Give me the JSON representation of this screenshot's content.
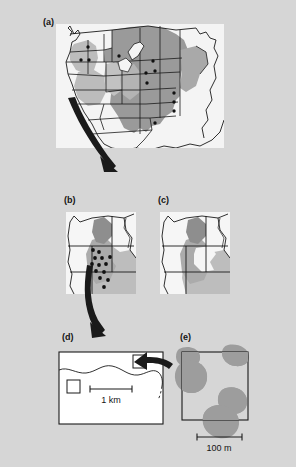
{
  "figure": {
    "type": "multi-panel-map-figure",
    "background_color": "#d6d6d6",
    "map_face_color": "#f2f2f2",
    "shade_dark": "#949494",
    "shade_mid": "#a8a8a8",
    "shade_light": "#bdbdbd",
    "outline_color": "#1a1a1a",
    "arrow_color": "#1a1a1a",
    "panels": [
      {
        "id": "a",
        "label": "(a)",
        "description": "Map of the western and central United States with state outlines; a broad block of north-central and central plains states is shaded gray, with smaller gray patches in the interior west. Small black dots mark study site locations within the shaded states. A thick tapering black arrow sweeps from the shaded region toward the lower left, pointing down to panel (b).",
        "shaded_region": "north-central and central Great Plains states",
        "site_markers": 12,
        "has_arrow_out": true,
        "scale_bar": null
      },
      {
        "id": "b",
        "label": "(b)",
        "description": "Regional inset of the Pacific Northwest / northern Great Basin showing state boundaries, a dark gray irregular highland area in the center, a lighter gray lowland area to the southeast, and a dense cluster of black dots marking sample sites. A thick tapering black arrow curves from the dot cluster down toward panel (d).",
        "site_markers": 13,
        "has_arrow_out": true,
        "scale_bar": null
      },
      {
        "id": "c",
        "label": "(c)",
        "description": "Companion regional inset covering the same area as panel (b), showing state boundaries with the dark gray highland and lighter gray lowland shading but no point markers.",
        "site_markers": 0,
        "has_arrow_out": false,
        "scale_bar": null
      },
      {
        "id": "d",
        "label": "(d)",
        "description": "Local-scale rectangular map with a white face and black border. A meandering stream line crosses the upper half from left to right. Two small open squares mark study plots, one at upper right and one at middle left. A thick black arrow enters from the right at the upper-right plot, pointing in from panel (b).",
        "plot_squares": 2,
        "stream": true,
        "has_arrow_in": true,
        "scale_bar": {
          "label": "1 km",
          "length_px": 60
        }
      },
      {
        "id": "e",
        "label": "(e)",
        "description": "Site-scale square map with a white face and black border showing five gray irregular blobs (vegetation patches / colonies), several overlapping the boundary at the upper left, upper right and lower right.",
        "patches": 5,
        "scale_bar": {
          "label": "100 m",
          "length_px": 48
        }
      }
    ],
    "scale_bars": [
      {
        "panel": "d",
        "label": "1 km"
      },
      {
        "panel": "e",
        "label": "100 m"
      }
    ]
  }
}
